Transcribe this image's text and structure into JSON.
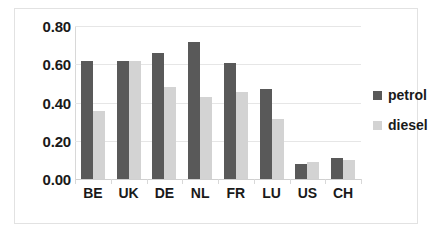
{
  "chart_data": {
    "type": "bar",
    "title": "",
    "xlabel": "",
    "ylabel": "",
    "categories": [
      "BE",
      "UK",
      "DE",
      "NL",
      "FR",
      "LU",
      "US",
      "CH"
    ],
    "series": [
      {
        "name": "petrol",
        "color": "#595959",
        "values": [
          0.615,
          0.615,
          0.66,
          0.715,
          0.605,
          0.47,
          0.08,
          0.11
        ]
      },
      {
        "name": "diesel",
        "color": "#d3d3d3",
        "values": [
          0.355,
          0.615,
          0.48,
          0.43,
          0.455,
          0.315,
          0.09,
          0.1
        ]
      }
    ],
    "ylim": [
      0.0,
      0.8
    ],
    "y_ticks": [
      0.0,
      0.2,
      0.4,
      0.6,
      0.8
    ],
    "y_tick_labels": [
      "0.00",
      "0.20",
      "0.40",
      "0.60",
      "0.80"
    ],
    "grid": true,
    "legend_position": "right",
    "legend_entries": [
      "petrol",
      "diesel"
    ],
    "annotations": []
  },
  "colors": {
    "petrol": "#595959",
    "diesel": "#d3d3d3",
    "gridline": "#e6e6e6",
    "border": "#e2e2e2",
    "text": "#1a1a1a",
    "background": "#ffffff"
  }
}
